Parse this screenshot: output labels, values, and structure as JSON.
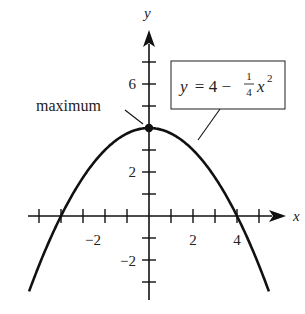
{
  "axes": {
    "x_label": "x",
    "y_label": "y",
    "x_tick_labels": [
      {
        "value": -2,
        "text": "−2"
      },
      {
        "value": 2,
        "text": "2"
      },
      {
        "value": 4,
        "text": "4"
      }
    ],
    "y_tick_labels": [
      {
        "value": 6,
        "text": "6"
      },
      {
        "value": 2,
        "text": "2"
      },
      {
        "value": -2,
        "text": "−2"
      }
    ],
    "x_ticks": [
      -5,
      -4,
      -3,
      -2,
      -1,
      1,
      2,
      3,
      4,
      5
    ],
    "y_ticks": [
      -3,
      -2,
      -1,
      1,
      2,
      3,
      5,
      6,
      7
    ],
    "x_range": [
      -5.5,
      6.5
    ],
    "y_range": [
      -3.7,
      8
    ]
  },
  "curve": {
    "equation": "y = 4 − (1/4)x²",
    "eq_prefix": "y = 4 − ",
    "eq_frac_num": "1",
    "eq_frac_den": "4",
    "eq_var": "x",
    "eq_exp": "2",
    "x_intercepts": [
      -4,
      4
    ],
    "vertex": [
      0,
      4
    ]
  },
  "annotations": {
    "maximum_label": "maximum"
  },
  "colors": {
    "ink": "#111111",
    "text": "#222222",
    "background": "#ffffff"
  }
}
